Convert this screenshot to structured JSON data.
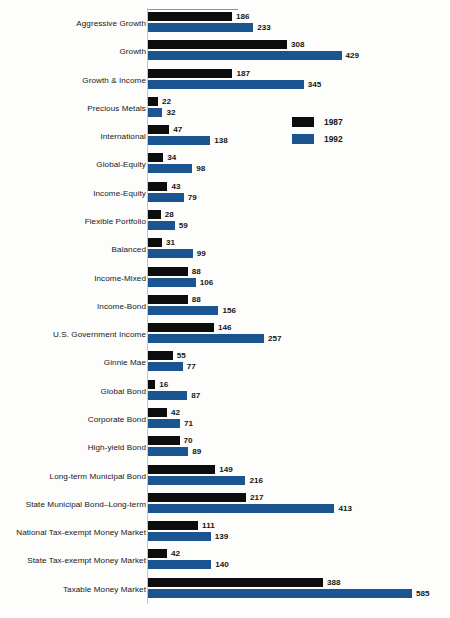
{
  "chart_data": {
    "type": "bar",
    "orientation": "horizontal",
    "title": "",
    "subtitle": "",
    "xlabel": "",
    "ylabel": "",
    "grid": false,
    "legend_position": "inside-upper-right",
    "xlim": [
      0,
      600
    ],
    "categories": [
      "Aggressive Growth",
      "Growth",
      "Growth & Income",
      "Precious Metals",
      "International",
      "Global-Equity",
      "Income-Equity",
      "Flexible Portfolio",
      "Balanced",
      "Income-Mixed",
      "Income-Bond",
      "U.S. Government Income",
      "Ginnie Mae",
      "Global Bond",
      "Corporate Bond",
      "High-yield Bond",
      "Long-term Municipal Bond",
      "State Municipal Bond–Long-term",
      "National Tax-exempt Money Market",
      "State Tax-exempt Money Market",
      "Taxable Money Market"
    ],
    "series": [
      {
        "name": "1987",
        "color": "#0d0d0d",
        "values": [
          186,
          308,
          187,
          22,
          47,
          34,
          43,
          28,
          31,
          88,
          88,
          146,
          55,
          16,
          42,
          70,
          149,
          217,
          111,
          42,
          388
        ]
      },
      {
        "name": "1992",
        "color": "#1a5591",
        "values": [
          233,
          429,
          345,
          32,
          138,
          98,
          79,
          59,
          99,
          106,
          156,
          257,
          77,
          87,
          71,
          89,
          216,
          413,
          139,
          140,
          585
        ]
      }
    ]
  },
  "legend": {
    "entries": [
      {
        "label": "1987",
        "color": "#0d0d0d"
      },
      {
        "label": "1992",
        "color": "#1a5591"
      }
    ]
  },
  "style": {
    "background": "#fdfdfc",
    "text_color": "#161616",
    "series_1987_color": "#0d0d0d",
    "series_1992_color": "#1a5591"
  }
}
